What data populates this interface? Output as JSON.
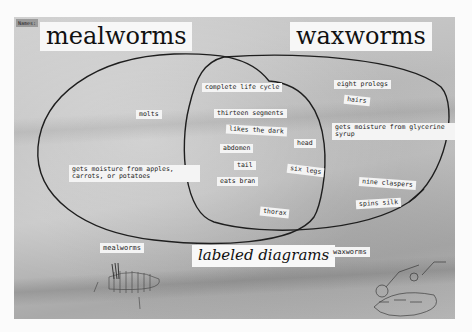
{
  "poster": {
    "corner_tag": "Names:",
    "left_title": "mealworms",
    "right_title": "waxworms",
    "colors": {
      "background": "#c2c2c2",
      "card": "#f6f6f6",
      "ink": "#111111",
      "outline": "#1e1e1e"
    }
  },
  "venn": {
    "left_set": "mealworms",
    "right_set": "waxworms",
    "left_only": [
      "molts",
      "gets moisture from apples, carrots, or potatoes"
    ],
    "both": [
      "complete life cycle",
      "thirteen segments",
      "likes the dark",
      "head",
      "abdomen",
      "tail",
      "six legs",
      "eats bran",
      "thorax"
    ],
    "right_only": [
      "eight prolegs",
      "hairs",
      "gets moisture from glycerine syrup",
      "nine claspers",
      "spins silk"
    ]
  },
  "bottom": {
    "left_diagram_label": "mealworms",
    "center_caption": "labeled diagrams",
    "right_diagram_label": "waxworms",
    "left_diagram_note": "antenna",
    "right_diagram_note": "head"
  }
}
